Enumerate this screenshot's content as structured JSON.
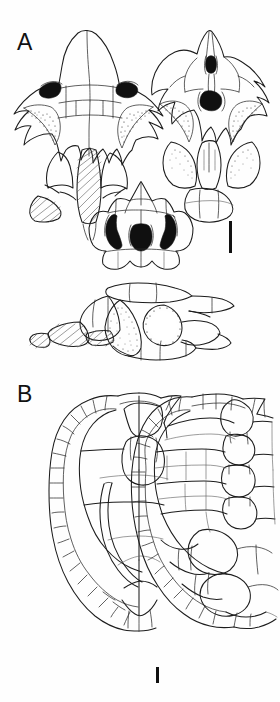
{
  "figure": {
    "type": "scientific-illustration-plate",
    "background_color": "#ffffff",
    "ink_color": "#1c1c1c",
    "panels": [
      {
        "id": "A",
        "label": "A",
        "description": "Skull reconstructed in four orthogonal views",
        "views": [
          {
            "name": "dorsal-skull-view",
            "position": "upper-left"
          },
          {
            "name": "ventral-skull-view",
            "position": "upper-right"
          },
          {
            "name": "posterior-skull-view",
            "position": "middle-center"
          },
          {
            "name": "lateral-skull-view",
            "position": "lower-center"
          }
        ],
        "scale_bar": {
          "name": "scale-bar-a",
          "orientation": "vertical",
          "color": "#111111"
        }
      },
      {
        "id": "B",
        "label": "B",
        "description": "Shell halves in dorsal (carapace) and visceral aspect",
        "views": [
          {
            "name": "carapace-left-view",
            "position": "left"
          },
          {
            "name": "carapace-right-view",
            "position": "right"
          }
        ],
        "scale_bar": {
          "name": "scale-bar-b",
          "orientation": "vertical",
          "color": "#111111"
        }
      }
    ]
  }
}
